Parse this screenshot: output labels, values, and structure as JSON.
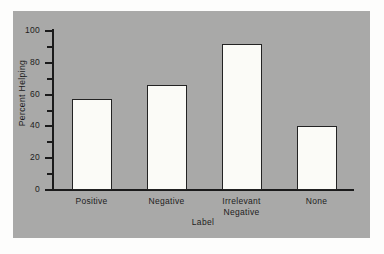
{
  "chart_data": {
    "type": "bar",
    "title": "",
    "xlabel": "Label",
    "ylabel": "Percent Helping",
    "categories": [
      "Positive",
      "Negative",
      "Irrelevant Negative",
      "None"
    ],
    "category_lines": [
      [
        "Positive"
      ],
      [
        "Negative"
      ],
      [
        "Irrelevant",
        "Negative"
      ],
      [
        "None"
      ]
    ],
    "values": [
      57,
      66,
      92,
      40
    ],
    "ylim": [
      0,
      100
    ],
    "yticks": [
      0,
      20,
      40,
      60,
      80,
      100
    ],
    "ytick_labels": [
      "0",
      "20",
      "40",
      "60",
      "80",
      "100"
    ],
    "yminorticks": [
      10,
      30,
      50,
      70,
      90
    ],
    "grid": false,
    "legend": null,
    "bar_fill_color": "#fbfbf7",
    "bar_edge_color": "#232323",
    "panel_background_color": "#a9a9a8",
    "axis_color": "#1b1b1b",
    "text_color": "#1d1d1d"
  }
}
